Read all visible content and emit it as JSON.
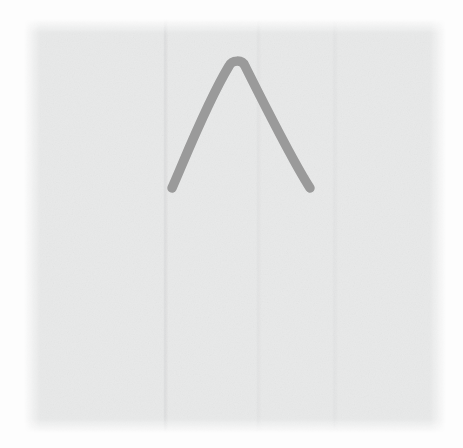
{
  "scene": {
    "title": "Hand-drawn caret mark on light gray canvas",
    "width": 463,
    "height": 448,
    "background_color": "#fdfdfd"
  },
  "canvas": {
    "name": "drawing-canvas",
    "fill_color": "#e8e9e9",
    "edge_style": "feathered",
    "texture": "paper-grain",
    "bounds": {
      "x": 24,
      "y": 19,
      "width": 422,
      "height": 414
    }
  },
  "mark": {
    "label": "caret",
    "glyph": "∧",
    "shape": "chevron-up",
    "stroke_color": "#9a9a9a",
    "stroke_width": 9.5,
    "line_cap": "round",
    "line_join": "round",
    "points": {
      "left_foot": {
        "x": 172,
        "y": 188
      },
      "apex": {
        "x": 237,
        "y": 56
      },
      "right_foot": {
        "x": 310,
        "y": 188
      }
    },
    "path": "M 172 188 C 182 166 206 104 229 66 C 232 60 242 59 245 66 C 266 108 292 160 310 188"
  }
}
